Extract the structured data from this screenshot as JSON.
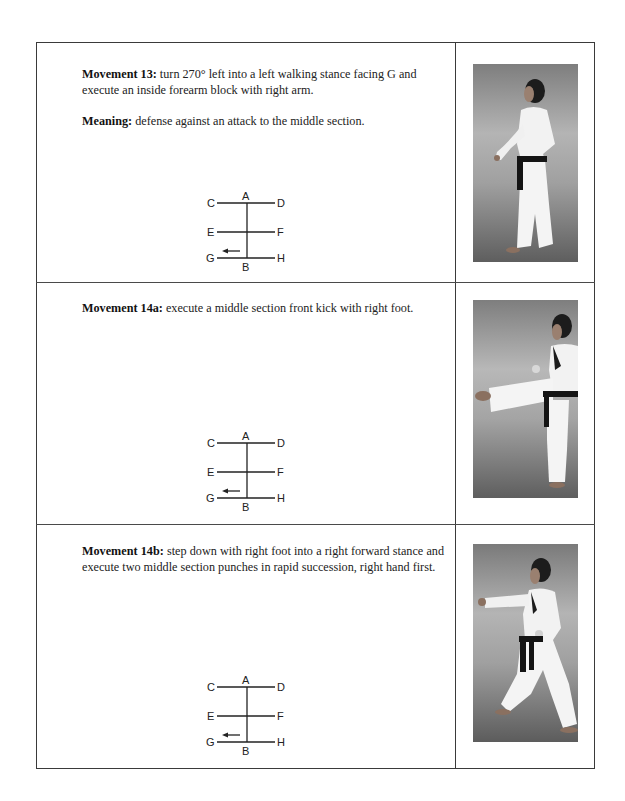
{
  "rows": [
    {
      "title": "Movement 13:",
      "text": " turn 270° left into a left walking stance facing G and execute an inside forearm block with right arm.",
      "meaning_label": "Meaning:",
      "meaning_text": " defense against an attack to the middle section.",
      "diagram": {
        "labels": {
          "top": "A",
          "bottom": "B",
          "l1": "C",
          "r1": "D",
          "l2": "E",
          "r2": "F",
          "l3": "G",
          "r3": "H"
        },
        "arrow": "left-toward-G"
      },
      "photo": {
        "description": "man in white dobok with black belt in left walking stance, right arm block",
        "pose": "walking-stance-block"
      }
    },
    {
      "title": "Movement 14a:",
      "text": " execute a middle section front kick with right foot.",
      "diagram": {
        "labels": {
          "top": "A",
          "bottom": "B",
          "l1": "C",
          "r1": "D",
          "l2": "E",
          "r2": "F",
          "l3": "G",
          "r3": "H"
        },
        "arrow": "left-toward-G"
      },
      "photo": {
        "description": "man in white dobok with black belt performing front kick",
        "pose": "front-kick"
      }
    },
    {
      "title": "Movement 14b:",
      "text": " step down with right foot into a right forward stance and execute two middle section punches in rapid succession, right hand first.",
      "diagram": {
        "labels": {
          "top": "A",
          "bottom": "B",
          "l1": "C",
          "r1": "D",
          "l2": "E",
          "r2": "F",
          "l3": "G",
          "r3": "H"
        },
        "arrow": "left-toward-G"
      },
      "photo": {
        "description": "man in white dobok with black belt in forward stance punching",
        "pose": "forward-stance-punch"
      }
    }
  ],
  "colors": {
    "border": "#3a3a3a",
    "text": "#222222",
    "photo_bg_top": "#8a8a8a",
    "photo_bg_bottom": "#5c5c5c",
    "belt": "#141414"
  }
}
